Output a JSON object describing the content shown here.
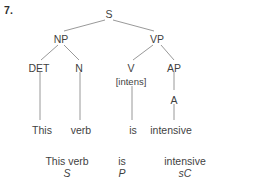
{
  "item": {
    "number": "7."
  },
  "tree": {
    "nodes": [
      {
        "id": "S",
        "label": "S",
        "x": 109,
        "y": 9
      },
      {
        "id": "NP",
        "label": "NP",
        "x": 61,
        "y": 34
      },
      {
        "id": "VP",
        "label": "VP",
        "x": 157,
        "y": 34
      },
      {
        "id": "DET",
        "label": "DET",
        "x": 39,
        "y": 63
      },
      {
        "id": "N",
        "label": "N",
        "x": 79,
        "y": 63
      },
      {
        "id": "V",
        "label": "V",
        "x": 131,
        "y": 63
      },
      {
        "id": "AP",
        "label": "AP",
        "x": 174,
        "y": 63
      },
      {
        "id": "FEAT",
        "label": "[intens]",
        "x": 131,
        "y": 76
      },
      {
        "id": "A",
        "label": "A",
        "x": 174,
        "y": 95
      }
    ],
    "terminals": [
      {
        "id": "t-this",
        "label": "This",
        "x": 42,
        "y": 125
      },
      {
        "id": "t-verb",
        "label": "verb",
        "x": 81,
        "y": 125
      },
      {
        "id": "t-is",
        "label": "is",
        "x": 133,
        "y": 125
      },
      {
        "id": "t-intensive",
        "label": "intensive",
        "x": 171,
        "y": 125
      }
    ]
  },
  "analysis": [
    {
      "phrase": "This verb",
      "function": "S",
      "x": 67,
      "y": 155
    },
    {
      "phrase": "is",
      "function": "P",
      "x": 122,
      "y": 155
    },
    {
      "phrase": "intensive",
      "function": "sC",
      "x": 185,
      "y": 155
    }
  ],
  "colors": {
    "text": "#3f3f3f",
    "edge": "#8d8d8d",
    "background": "#ffffff"
  }
}
